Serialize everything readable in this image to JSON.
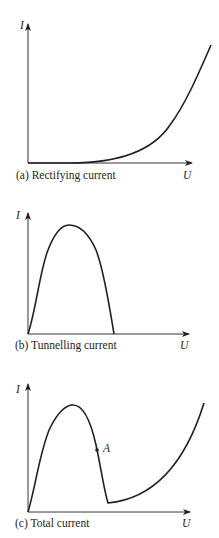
{
  "figure": {
    "panels": [
      {
        "id": "a",
        "caption": "(a)  Rectifying current",
        "y_label": "I",
        "x_label": "U"
      },
      {
        "id": "b",
        "caption": "(b)  Tunnelling current",
        "y_label": "I",
        "x_label": "U"
      },
      {
        "id": "c",
        "caption": "(c)  Total current",
        "y_label": "I",
        "x_label": "U",
        "point_label": "A"
      }
    ],
    "colors": {
      "ink": "#231f20",
      "background": "#ffffff"
    }
  }
}
